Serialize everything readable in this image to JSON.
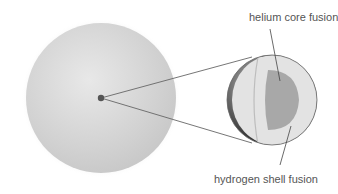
{
  "diagram": {
    "labels": {
      "core": "helium core fusion",
      "shell": "hydrogen shell fusion"
    },
    "colors": {
      "background": "#ffffff",
      "star_outer": "#cfcfcf",
      "star_highlight": "#e6e6e6",
      "core_dot": "#555555",
      "cutaway_shell": "#e4e4e4",
      "cutaway_core": "#a9a9a9",
      "cutaway_outer_dark": "#3a3a3a",
      "line": "#666666",
      "text": "#555555"
    }
  }
}
